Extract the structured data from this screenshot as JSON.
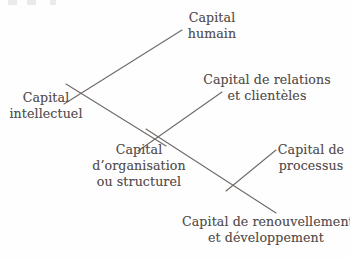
{
  "diagram": {
    "type": "tree",
    "language": "fr",
    "ink_color": "#56504e",
    "line_color": "#6f6864",
    "background_color": "#fefefe",
    "nodes": {
      "root": {
        "lines": [
          "Capital",
          "intellectuel"
        ],
        "level": 0
      },
      "humain": {
        "lines": [
          "Capital",
          "humain"
        ],
        "level": 1
      },
      "structurel": {
        "lines": [
          "Capital",
          "d’organisation",
          "ou structurel"
        ],
        "level": 1
      },
      "relations": {
        "lines": [
          "Capital de relations",
          "et clientèles"
        ],
        "level": 2
      },
      "processus": {
        "lines": [
          "Capital de",
          "processus"
        ],
        "level": 2
      },
      "renouvellement": {
        "lines": [
          "Capital de renouvellement",
          "et développement"
        ],
        "level": 2
      }
    },
    "edges": [
      {
        "id": "edge-root-humain",
        "from": "root",
        "to": "humain",
        "x1": 64,
        "y1": 104,
        "x2": 182,
        "y2": 30
      },
      {
        "id": "edge-root-structurel",
        "from": "root",
        "to": "structurel",
        "x1": 66,
        "y1": 84,
        "x2": 166,
        "y2": 146
      },
      {
        "id": "edge-structurel-relations",
        "from": "structurel",
        "to": "relations",
        "x1": 138,
        "y1": 151,
        "x2": 222,
        "y2": 92
      },
      {
        "id": "edge-structurel-branch",
        "from": "structurel",
        "to": "branch-vertex",
        "x1": 146,
        "y1": 129,
        "x2": 276,
        "y2": 213
      },
      {
        "id": "edge-branch-processus",
        "from": "branch-vertex",
        "to": "processus",
        "x1": 226,
        "y1": 191,
        "x2": 276,
        "y2": 150
      }
    ]
  }
}
